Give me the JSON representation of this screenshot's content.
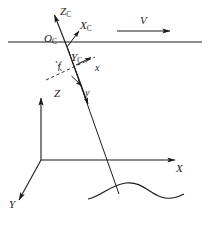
{
  "figure": {
    "type": "diagram"
  },
  "labels": {
    "camera_origin": {
      "base": "O",
      "sub": "C"
    },
    "camera_x": {
      "base": "X",
      "sub": "C"
    },
    "camera_y": {
      "base": "Y",
      "sub": "C"
    },
    "camera_z": {
      "base": "Z",
      "sub": "C"
    },
    "image_x": "x",
    "image_y": "y",
    "focal_length": "f",
    "velocity": "V",
    "world_x": "X",
    "world_y": "Y",
    "world_z": "Z"
  },
  "colors": {
    "stroke": "#1a1a1a",
    "background": "#ffffff"
  },
  "geometry": {
    "flight_line": {
      "x1": 8,
      "y1": 42,
      "x2": 202,
      "y2": 42
    },
    "velocity_arrow": {
      "x1": 117,
      "y1": 31,
      "x2": 172,
      "y2": 31
    },
    "camera_center": {
      "x": 67,
      "y": 47
    },
    "camera_z_axis": {
      "x1": 67,
      "y1": 47,
      "x2": 53,
      "y2": 12
    },
    "camera_x_axis": {
      "x1": 67,
      "y1": 47,
      "x2": 80,
      "y2": 29
    },
    "camera_y_axis": {
      "x1": 67,
      "y1": 47,
      "x2": 90,
      "y2": 110
    },
    "image_plane": {
      "x1": 48,
      "y1": 78,
      "x2": 95,
      "y2": 57
    },
    "image_x_arrow": {
      "x1": 77,
      "y1": 64,
      "x2": 93,
      "y2": 56
    },
    "image_y_arrow": {
      "x1": 72,
      "y1": 78,
      "x2": 84,
      "y2": 88
    },
    "principal_ray": {
      "x1": 67,
      "y1": 47,
      "x2": 118,
      "y2": 192
    },
    "world_origin": {
      "x": 41,
      "y": 160
    },
    "world_z_axis": {
      "x1": 41,
      "y1": 160,
      "x2": 41,
      "y2": 95
    },
    "world_x_axis": {
      "x1": 41,
      "y1": 160,
      "x2": 178,
      "y2": 160
    },
    "world_y_axis": {
      "x1": 41,
      "y1": 160,
      "x2": 16,
      "y2": 205
    },
    "terrain_curve": "M 88 199 C 104 196 112 184 126 183 C 142 182 148 193 160 197 C 170 200 178 197 183 194"
  }
}
